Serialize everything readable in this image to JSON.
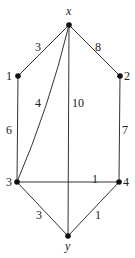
{
  "graph": {
    "nodes": [
      {
        "id": "x",
        "label": "x",
        "cx": 69,
        "cy": 25,
        "lx": 66,
        "ly": 15,
        "italic": true
      },
      {
        "id": "1",
        "label": "1",
        "cx": 18,
        "cy": 76,
        "lx": 6,
        "ly": 80,
        "italic": false
      },
      {
        "id": "2",
        "label": "2",
        "cx": 120,
        "cy": 76,
        "lx": 124,
        "ly": 80,
        "italic": false
      },
      {
        "id": "3",
        "label": "3",
        "cx": 17,
        "cy": 182,
        "lx": 6,
        "ly": 186,
        "italic": false
      },
      {
        "id": "4",
        "label": "4",
        "cx": 119,
        "cy": 182,
        "lx": 123,
        "ly": 186,
        "italic": false
      },
      {
        "id": "y",
        "label": "y",
        "cx": 68,
        "cy": 236,
        "lx": 65,
        "ly": 250,
        "italic": true
      }
    ],
    "edges": [
      {
        "from": "x",
        "to": "1",
        "weight": "3",
        "lx": 35,
        "ly": 51,
        "curve": false
      },
      {
        "from": "x",
        "to": "2",
        "weight": "8",
        "lx": 95,
        "ly": 51,
        "curve": false
      },
      {
        "from": "x",
        "to": "3",
        "weight": "4",
        "lx": 35,
        "ly": 107,
        "curve": true
      },
      {
        "from": "x",
        "to": "y",
        "weight": "10",
        "lx": 72,
        "ly": 107,
        "curve": false
      },
      {
        "from": "1",
        "to": "3",
        "weight": "6",
        "lx": 6,
        "ly": 134,
        "curve": false
      },
      {
        "from": "2",
        "to": "4",
        "weight": "7",
        "lx": 122,
        "ly": 134,
        "curve": false
      },
      {
        "from": "3",
        "to": "4",
        "weight": "1",
        "lx": 92,
        "ly": 183,
        "curve": false
      },
      {
        "from": "3",
        "to": "y",
        "weight": "3",
        "lx": 36,
        "ly": 219,
        "curve": false
      },
      {
        "from": "4",
        "to": "y",
        "weight": "1",
        "lx": 95,
        "ly": 219,
        "curve": false
      }
    ]
  }
}
